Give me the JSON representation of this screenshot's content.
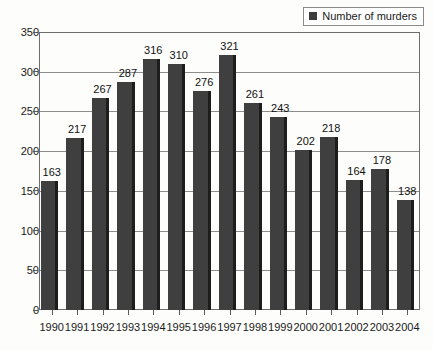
{
  "chart_data": {
    "type": "bar",
    "title": "",
    "subtitle": "",
    "xlabel": "",
    "ylabel": "",
    "categories": [
      "1990",
      "1991",
      "1992",
      "1993",
      "1994",
      "1995",
      "1996",
      "1997",
      "1998",
      "1999",
      "2000",
      "2001",
      "2002",
      "2003",
      "2004"
    ],
    "values": [
      163,
      217,
      267,
      287,
      316,
      310,
      276,
      321,
      261,
      243,
      202,
      218,
      164,
      178,
      138
    ],
    "series": [
      {
        "name": "Number of murders",
        "values": [
          163,
          217,
          267,
          287,
          316,
          310,
          276,
          321,
          261,
          243,
          202,
          218,
          164,
          178,
          138
        ]
      }
    ],
    "ylim": [
      0,
      350
    ],
    "ytick_values": [
      0,
      50,
      100,
      150,
      200,
      250,
      300,
      350
    ],
    "ytick_labels": [
      "0",
      "50",
      "100",
      "150",
      "200",
      "250",
      "300",
      "350"
    ],
    "grid": true,
    "grid_axis": "y",
    "legend": {
      "position": "top-right",
      "entries": [
        {
          "label": "Number of murders",
          "color": "#3f3f3f",
          "swatch": "legend-swatch-icon"
        }
      ]
    },
    "data_labels": true,
    "colors": {
      "bar_fill": "#3f3f3f",
      "bar_edge": "#1d1d1d",
      "grid": "#8d8d8d",
      "frame": "#6e6e6e",
      "text": "#1a1a1a",
      "background": "#fdfdfb"
    }
  }
}
